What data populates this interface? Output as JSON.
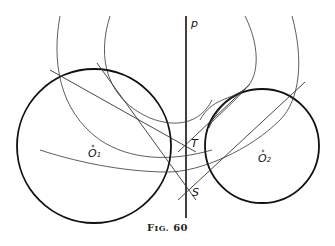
{
  "figure": {
    "caption_prefix": "F",
    "caption_smallcaps": "IG.",
    "caption_number": "60"
  },
  "labels": {
    "line": "p",
    "point_t": "T",
    "point_s": "S",
    "center1_letter": "O",
    "center1_sub": "1",
    "center2_letter": "O",
    "center2_sub": "2"
  },
  "geometry": {
    "line_p": {
      "x": 186,
      "y1": 16,
      "y2": 218
    },
    "circle_o1": {
      "cx": 94,
      "cy": 146,
      "r": 77
    },
    "circle_o2": {
      "cx": 262,
      "cy": 146,
      "r": 57
    },
    "point_t": {
      "x": 186,
      "y": 143
    },
    "point_s": {
      "x": 186,
      "y": 192
    }
  },
  "colors": {
    "stroke": "#111111",
    "thin_stroke": "#333333"
  }
}
